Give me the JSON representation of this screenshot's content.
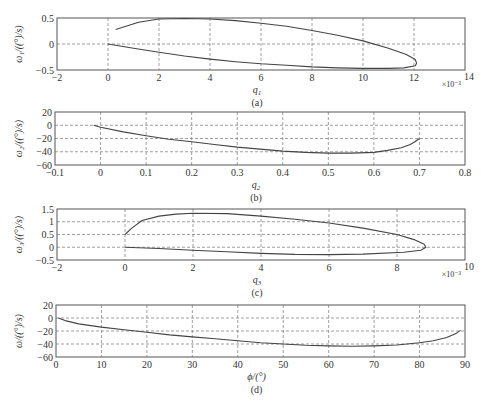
{
  "figure": {
    "panels": [
      {
        "id": "a",
        "caption": "(a)",
        "xlabel_var": "q",
        "xlabel_sub": "1",
        "ylabel": "ω₁/((°)/s)",
        "x_multiplier": "×10⁻³"
      },
      {
        "id": "b",
        "caption": "(b)",
        "xlabel_var": "q",
        "xlabel_sub": "2",
        "ylabel": "ω₂/((°)/s)",
        "x_multiplier": ""
      },
      {
        "id": "c",
        "caption": "(c)",
        "xlabel_var": "q",
        "xlabel_sub": "3",
        "ylabel": "ω₃/((°)/s)",
        "x_multiplier": "×10⁻³"
      },
      {
        "id": "d",
        "caption": "(d)",
        "xlabel_var": "ϕ/(°)",
        "xlabel_sub": "",
        "ylabel": "ω/((°)/s)",
        "x_multiplier": ""
      }
    ]
  },
  "chart_data": [
    {
      "type": "line",
      "title": "(a)",
      "xlabel": "q1 (×10^-3)",
      "ylabel": "ω1/((°)/s)",
      "xlim": [
        -2,
        14
      ],
      "ylim": [
        -0.5,
        0.5
      ],
      "xticks": [
        -2,
        0,
        2,
        4,
        6,
        8,
        10,
        12,
        14
      ],
      "xtick_labels": [
        "−2",
        "0",
        "2",
        "4",
        "6",
        "8",
        "10",
        "12",
        "14"
      ],
      "yticks": [
        -0.5,
        0,
        0.5
      ],
      "ytick_labels": [
        "−0.5",
        "0",
        "0.5"
      ],
      "grid": true,
      "series": [
        {
          "name": "trajectory",
          "x": [
            0.3,
            1.2,
            2.0,
            3.0,
            4.0,
            5.0,
            6.0,
            7.0,
            8.0,
            9.0,
            10.0,
            11.0,
            11.7,
            12.05,
            12.1,
            12.05,
            11.6,
            11.0,
            10.0,
            9.0,
            8.0,
            7.0,
            6.0,
            5.0,
            4.0,
            3.0,
            2.0,
            1.0,
            0.0
          ],
          "y": [
            0.28,
            0.42,
            0.48,
            0.49,
            0.48,
            0.45,
            0.4,
            0.34,
            0.26,
            0.17,
            0.06,
            -0.08,
            -0.2,
            -0.3,
            -0.37,
            -0.42,
            -0.46,
            -0.47,
            -0.47,
            -0.46,
            -0.44,
            -0.41,
            -0.38,
            -0.34,
            -0.29,
            -0.23,
            -0.16,
            -0.08,
            0.0
          ]
        }
      ]
    },
    {
      "type": "line",
      "title": "(b)",
      "xlabel": "q2",
      "ylabel": "ω2/((°)/s)",
      "xlim": [
        -0.1,
        0.8
      ],
      "ylim": [
        -60,
        20
      ],
      "xticks": [
        -0.1,
        0,
        0.1,
        0.2,
        0.3,
        0.4,
        0.5,
        0.6,
        0.7,
        0.8
      ],
      "xtick_labels": [
        "−0.1",
        "0",
        "0.1",
        "0.2",
        "0.3",
        "0.4",
        "0.5",
        "0.6",
        "0.7",
        "0.8"
      ],
      "yticks": [
        -60,
        -40,
        -20,
        0,
        20
      ],
      "ytick_labels": [
        "−60",
        "−40",
        "−20",
        "0",
        "20"
      ],
      "grid": true,
      "series": [
        {
          "name": "trajectory",
          "x": [
            -0.015,
            0.0,
            0.05,
            0.1,
            0.15,
            0.2,
            0.25,
            0.3,
            0.35,
            0.4,
            0.45,
            0.5,
            0.55,
            0.6,
            0.63,
            0.66,
            0.68,
            0.69,
            0.7
          ],
          "y": [
            0,
            -3,
            -10,
            -16,
            -21,
            -25,
            -29,
            -33,
            -36,
            -39,
            -41,
            -42,
            -42,
            -41,
            -38,
            -34,
            -29,
            -25,
            -20
          ]
        }
      ]
    },
    {
      "type": "line",
      "title": "(c)",
      "xlabel": "q3 (×10^-3)",
      "ylabel": "ω3/((°)/s)",
      "xlim": [
        -2,
        10
      ],
      "ylim": [
        -0.5,
        1.5
      ],
      "xticks": [
        -2,
        0,
        2,
        4,
        6,
        8,
        10
      ],
      "xtick_labels": [
        "−2",
        "0",
        "2",
        "4",
        "6",
        "8",
        "10"
      ],
      "yticks": [
        -0.5,
        0,
        0.5,
        1,
        1.5
      ],
      "ytick_labels": [
        "−0.5",
        "0",
        "0.5",
        "1",
        "1.5"
      ],
      "grid": true,
      "series": [
        {
          "name": "trajectory",
          "x": [
            0.0,
            0.2,
            0.5,
            1.0,
            1.5,
            2.0,
            3.0,
            4.0,
            5.0,
            6.0,
            7.0,
            8.0,
            8.5,
            8.8,
            8.85,
            8.7,
            8.2,
            7.0,
            6.0,
            5.0,
            4.0,
            3.0,
            2.0,
            1.0,
            0.0
          ],
          "y": [
            0.5,
            0.75,
            1.05,
            1.22,
            1.3,
            1.33,
            1.32,
            1.22,
            1.1,
            0.95,
            0.75,
            0.5,
            0.3,
            0.12,
            0.0,
            -0.12,
            -0.2,
            -0.27,
            -0.29,
            -0.28,
            -0.24,
            -0.18,
            -0.12,
            -0.05,
            0.0
          ]
        }
      ]
    },
    {
      "type": "line",
      "title": "(d)",
      "xlabel": "ϕ/(°)",
      "ylabel": "ω/((°)/s)",
      "xlim": [
        0,
        90
      ],
      "ylim": [
        -60,
        20
      ],
      "xticks": [
        0,
        10,
        20,
        30,
        40,
        50,
        60,
        70,
        80,
        90
      ],
      "xtick_labels": [
        "0",
        "10",
        "20",
        "30",
        "40",
        "50",
        "60",
        "70",
        "80",
        "90"
      ],
      "yticks": [
        -60,
        -40,
        -20,
        0,
        20
      ],
      "ytick_labels": [
        "−60",
        "−40",
        "−20",
        "0",
        "20"
      ],
      "grid": true,
      "series": [
        {
          "name": "trajectory",
          "x": [
            0.5,
            2,
            5,
            10,
            15,
            20,
            25,
            30,
            35,
            40,
            45,
            50,
            55,
            60,
            65,
            70,
            75,
            80,
            83,
            86,
            88,
            89
          ],
          "y": [
            0,
            -4,
            -9,
            -14,
            -18,
            -22,
            -26,
            -29,
            -32,
            -35,
            -38,
            -40,
            -42,
            -43,
            -43.5,
            -43,
            -41.5,
            -38,
            -35,
            -30,
            -24,
            -19
          ]
        }
      ]
    }
  ]
}
